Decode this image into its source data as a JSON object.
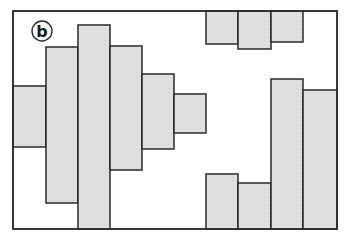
{
  "figure": {
    "label": "b",
    "frame": {
      "x": 13,
      "y": 11,
      "width": 324,
      "height": 218
    },
    "colors": {
      "fill": "#e2e2e2",
      "stroke": "#2a2a2a",
      "background": "#ffffff"
    },
    "left_bars": [
      {
        "x": 13,
        "y": 86,
        "width": 33,
        "height": 61
      },
      {
        "x": 46,
        "y": 47,
        "width": 32,
        "height": 156
      },
      {
        "x": 78,
        "y": 25,
        "width": 32,
        "height": 204
      },
      {
        "x": 110,
        "y": 46,
        "width": 32,
        "height": 124
      },
      {
        "x": 142,
        "y": 74,
        "width": 32,
        "height": 75
      },
      {
        "x": 174,
        "y": 94,
        "width": 32,
        "height": 39
      }
    ],
    "top_right_bars": [
      {
        "x": 206,
        "y": 11,
        "width": 32,
        "height": 33
      },
      {
        "x": 238,
        "y": 11,
        "width": 33,
        "height": 38
      },
      {
        "x": 271,
        "y": 11,
        "width": 32,
        "height": 31
      }
    ],
    "bottom_right_bars": [
      {
        "x": 206,
        "y": 174,
        "width": 32,
        "height": 55
      },
      {
        "x": 238,
        "y": 183,
        "width": 33,
        "height": 46
      },
      {
        "x": 271,
        "y": 79,
        "width": 32,
        "height": 150
      },
      {
        "x": 303,
        "y": 90,
        "width": 34,
        "height": 139
      }
    ]
  }
}
